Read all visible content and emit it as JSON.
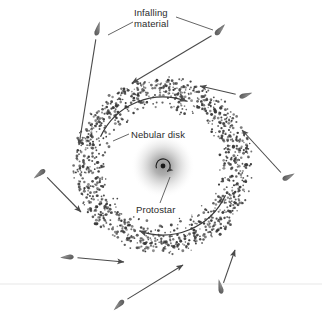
{
  "figure": {
    "background_color": "#ffffff",
    "width": 322,
    "height": 317,
    "ink_color": "#4a4a4a",
    "text_color": "#2b2b2b",
    "dust_color": "#3a3a3a"
  },
  "labels": {
    "infalling_material": "Infalling\nmaterial",
    "nebular_disk": "Nebular disk",
    "protostar": "Protostar"
  },
  "diagram_data": {
    "type": "diagram",
    "center": {
      "x": 163,
      "y": 166
    },
    "protostar": {
      "glow_radius": 32,
      "core_radius": 2.4,
      "core_color": "#1a1a1a",
      "glow_color": "#9a9a9a",
      "spin_arrow": "clockwise"
    },
    "nebular_disk": {
      "inner_radius": 54,
      "outer_radius": 90,
      "dot_count": 1500,
      "dot_radius_min": 0.7,
      "dot_radius_max": 1.5,
      "rotation_arrows": [
        {
          "name": "upper-left-rotation-arrow",
          "start_angle": 205,
          "end_angle": 290,
          "radius": 69
        },
        {
          "name": "lower-right-rotation-arrow",
          "start_angle": 25,
          "end_angle": 110,
          "radius": 69
        }
      ]
    },
    "infalling_blobs": [
      {
        "name": "blob-top-left",
        "x": 97,
        "y": 32,
        "angle": 104,
        "len": 9.5,
        "w": 5.0,
        "arrow_to": {
          "x": 79,
          "y": 145
        }
      },
      {
        "name": "blob-top-right",
        "x": 218,
        "y": 32,
        "angle": 132,
        "len": 9.0,
        "w": 5.2,
        "arrow_to": {
          "x": 132,
          "y": 83
        }
      },
      {
        "name": "blob-right-upper",
        "x": 243,
        "y": 96,
        "angle": 160,
        "len": 8.5,
        "w": 5.0,
        "arrow_to": {
          "x": 200,
          "y": 86
        }
      },
      {
        "name": "blob-right-lower",
        "x": 286,
        "y": 178,
        "angle": 152,
        "len": 8.5,
        "w": 5.0,
        "arrow_to": {
          "x": 242,
          "y": 130
        }
      },
      {
        "name": "blob-left-middle",
        "x": 42,
        "y": 172,
        "angle": 322,
        "len": 9.0,
        "w": 5.0,
        "arrow_to": {
          "x": 81,
          "y": 212
        }
      },
      {
        "name": "blob-left-lower",
        "x": 70,
        "y": 257,
        "angle": 357,
        "len": 8.5,
        "w": 5.0,
        "arrow_to": {
          "x": 124,
          "y": 262
        }
      },
      {
        "name": "blob-bottom-left",
        "x": 121,
        "y": 303,
        "angle": 315,
        "len": 9.0,
        "w": 5.0,
        "arrow_to": {
          "x": 183,
          "y": 265
        }
      },
      {
        "name": "blob-bottom-right",
        "x": 221,
        "y": 290,
        "angle": 78,
        "len": 9.5,
        "w": 5.0,
        "arrow_to": {
          "x": 235,
          "y": 250
        }
      }
    ],
    "leader_lines": [
      {
        "name": "infalling-leader-left",
        "from": {
          "x": 133,
          "y": 22
        },
        "to": {
          "x": 108,
          "y": 35
        }
      },
      {
        "name": "infalling-leader-right",
        "from": {
          "x": 176,
          "y": 17
        },
        "to": {
          "x": 213,
          "y": 30
        }
      },
      {
        "name": "nebular-disk-leader",
        "from": {
          "x": 129,
          "y": 134
        },
        "to": {
          "x": 113,
          "y": 141
        }
      },
      {
        "name": "protostar-leader",
        "from": {
          "x": 160,
          "y": 203
        },
        "to": {
          "x": 170,
          "y": 177
        }
      }
    ],
    "scan_line": {
      "y": 284,
      "color": "#efefef"
    }
  }
}
